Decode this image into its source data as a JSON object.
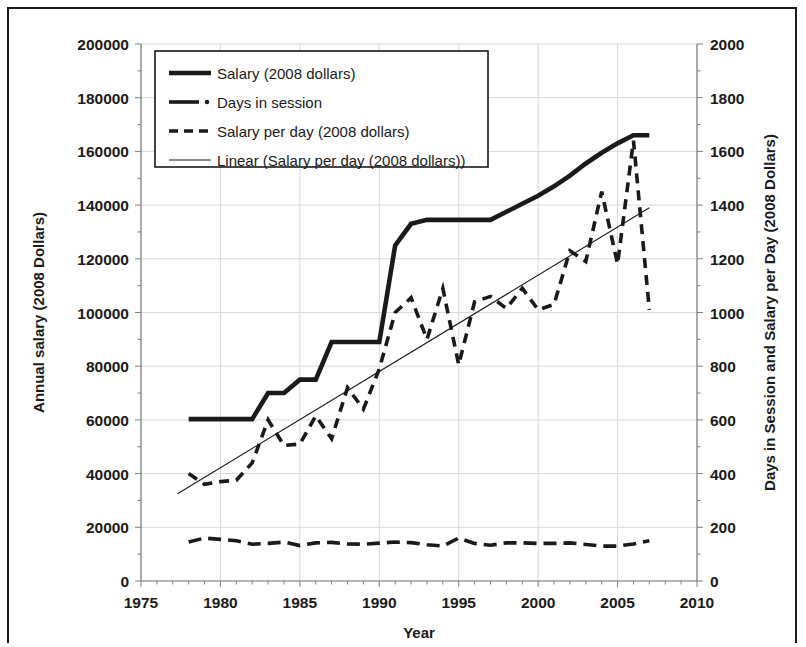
{
  "chart_data": {
    "type": "line",
    "title": "",
    "xlabel": "Year",
    "ylabel": "Annual salary (2008 Dollars)",
    "y2label": "Days in Session and Salary per Day (2008 Dollars)",
    "xlim": [
      1975,
      2010
    ],
    "ylim": [
      0,
      200000
    ],
    "y2lim": [
      0,
      2000
    ],
    "xticks": [
      1975,
      1980,
      1985,
      1990,
      1995,
      2000,
      2005,
      2010
    ],
    "yticks": [
      0,
      20000,
      40000,
      60000,
      80000,
      100000,
      120000,
      140000,
      160000,
      180000,
      200000
    ],
    "y2ticks": [
      0,
      200,
      400,
      600,
      800,
      1000,
      1200,
      1400,
      1600,
      1800,
      2000
    ],
    "xminor_step": 1,
    "grid": true,
    "legend_position": "upper-left",
    "x": [
      1978,
      1979,
      1980,
      1981,
      1982,
      1983,
      1984,
      1985,
      1986,
      1987,
      1988,
      1989,
      1990,
      1991,
      1992,
      1993,
      1994,
      1995,
      1996,
      1997,
      1998,
      1999,
      2000,
      2001,
      2002,
      2003,
      2004,
      2005,
      2006,
      2007
    ],
    "series": [
      {
        "name": "Salary (2008 dollars)",
        "axis": "left",
        "style": "solid-thick",
        "values": [
          60300,
          60300,
          60300,
          60300,
          60300,
          70000,
          70000,
          75000,
          75000,
          89000,
          89000,
          89000,
          89000,
          125000,
          133000,
          134500,
          134500,
          134500,
          134500,
          134500,
          137500,
          140500,
          143500,
          147000,
          151000,
          155500,
          159500,
          163000,
          166000,
          166000
        ]
      },
      {
        "name": "Days in session",
        "axis": "right",
        "style": "dash-dot",
        "values": [
          145,
          160,
          155,
          150,
          137,
          140,
          145,
          132,
          142,
          144,
          138,
          137,
          141,
          145,
          143,
          135,
          130,
          160,
          140,
          133,
          142,
          142,
          140,
          140,
          142,
          136,
          130,
          130,
          138,
          150
        ]
      },
      {
        "name": "Salary per day (2008 dollars)",
        "axis": "right",
        "style": "dashed-thick",
        "values": [
          400,
          360,
          370,
          375,
          440,
          600,
          505,
          510,
          615,
          530,
          720,
          640,
          790,
          1000,
          1055,
          900,
          1090,
          805,
          1040,
          1060,
          1015,
          1090,
          1010,
          1030,
          1230,
          1190,
          1450,
          1180,
          1640,
          1010
        ]
      },
      {
        "name": "Linear (Salary per day (2008 dollars))",
        "axis": "right",
        "style": "thin-solid",
        "trend": true,
        "x_start": 1977.3,
        "y_start": 325,
        "x_end": 2007.0,
        "y_end": 1390
      }
    ],
    "legend": [
      {
        "label": "Salary (2008 dollars)",
        "style": "solid-thick"
      },
      {
        "label": "Days in session",
        "style": "dash-dot"
      },
      {
        "label": "Salary per day (2008 dollars)",
        "style": "dashed-thick"
      },
      {
        "label": "Linear (Salary per day (2008 dollars))",
        "style": "thin-solid"
      }
    ],
    "colors": {
      "line": "#1a1a1a",
      "grid": "#d9d9d9",
      "axis": "#7f7f7f",
      "background": "#ffffff"
    }
  }
}
